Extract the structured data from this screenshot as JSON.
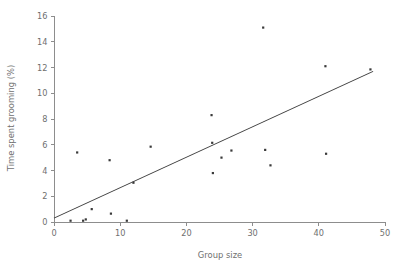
{
  "chart_data": {
    "type": "scatter",
    "title": "",
    "xlabel": "Group size",
    "ylabel": "Time spent grooming (%)",
    "xlim": [
      0,
      50
    ],
    "ylim": [
      0,
      16
    ],
    "xticks": [
      0,
      10,
      20,
      30,
      40,
      50
    ],
    "yticks": [
      0,
      2,
      4,
      6,
      8,
      10,
      12,
      14,
      16
    ],
    "xtick_labels": [
      "0",
      "10",
      "20",
      "30",
      "40",
      "50"
    ],
    "ytick_labels": [
      "0",
      "2",
      "4",
      "6",
      "8",
      "10",
      "12",
      "14",
      "16"
    ],
    "grid": false,
    "legend": null,
    "marker": "filled-square",
    "marker_color": "#3a3a3a",
    "points": [
      {
        "x": 2.5,
        "y": 0.1
      },
      {
        "x": 3.5,
        "y": 5.4
      },
      {
        "x": 4.4,
        "y": 0.1
      },
      {
        "x": 4.8,
        "y": 0.2
      },
      {
        "x": 5.7,
        "y": 1.0
      },
      {
        "x": 8.4,
        "y": 4.8
      },
      {
        "x": 8.6,
        "y": 0.65
      },
      {
        "x": 11.0,
        "y": 0.1
      },
      {
        "x": 12.0,
        "y": 3.05
      },
      {
        "x": 14.6,
        "y": 5.85
      },
      {
        "x": 23.8,
        "y": 8.3
      },
      {
        "x": 23.9,
        "y": 6.15
      },
      {
        "x": 24.0,
        "y": 3.8
      },
      {
        "x": 25.3,
        "y": 5.0
      },
      {
        "x": 26.8,
        "y": 5.55
      },
      {
        "x": 31.6,
        "y": 15.1
      },
      {
        "x": 31.9,
        "y": 5.6
      },
      {
        "x": 32.7,
        "y": 4.4
      },
      {
        "x": 41.0,
        "y": 12.1
      },
      {
        "x": 41.1,
        "y": 5.3
      },
      {
        "x": 47.8,
        "y": 11.85
      }
    ],
    "fit_line": {
      "type": "linear-regression",
      "x0": 0.0,
      "y0": 0.3,
      "x1": 48.2,
      "y1": 11.7
    },
    "colors": {
      "axis": "#8d8d8d",
      "tick_text": "#6f6f6f",
      "marker": "#3a3a3a",
      "fit_line": "#3d3d3d",
      "background": "#ffffff"
    }
  }
}
